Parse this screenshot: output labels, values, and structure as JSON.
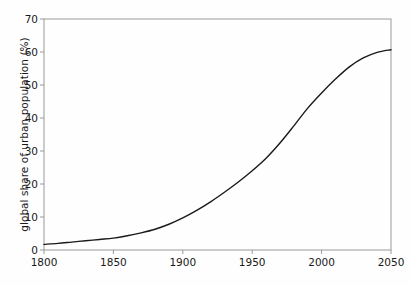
{
  "chart_data": {
    "type": "line",
    "title": "",
    "subtitle": "",
    "xlabel": "",
    "ylabel": "global share of urban population (%)",
    "xlim": [
      1800,
      2050
    ],
    "ylim": [
      0,
      70
    ],
    "xticks": [
      1800,
      1850,
      1900,
      1950,
      2000,
      2050
    ],
    "yticks": [
      0,
      10,
      20,
      30,
      40,
      50,
      60,
      70
    ],
    "xtick_labels": [
      "1800",
      "1850",
      "1900",
      "1950",
      "2000",
      "2050"
    ],
    "ytick_labels": [
      "0",
      "10",
      "20",
      "30",
      "40",
      "50",
      "60",
      "70"
    ],
    "grid": false,
    "legend": null,
    "legend_position": "none",
    "annotations": [],
    "line_color": "#1a1a1a",
    "line_width": 1.4,
    "axis_color": "#9a9a9a",
    "background_color": "#fefefe",
    "series": [
      {
        "name": "global share of urban population",
        "x": [
          1800,
          1810,
          1820,
          1830,
          1840,
          1850,
          1860,
          1870,
          1880,
          1890,
          1900,
          1910,
          1920,
          1930,
          1940,
          1950,
          1960,
          1970,
          1980,
          1990,
          2000,
          2010,
          2020,
          2030,
          2040,
          2050
        ],
        "values": [
          1.7,
          2.0,
          2.4,
          2.8,
          3.2,
          3.6,
          4.3,
          5.2,
          6.3,
          7.8,
          9.7,
          12.0,
          14.6,
          17.5,
          20.6,
          24.0,
          27.8,
          32.4,
          37.6,
          43.0,
          47.6,
          51.8,
          55.5,
          58.2,
          59.9,
          60.7
        ]
      }
    ]
  },
  "plot_geometry": {
    "left": 44,
    "right": 391,
    "top": 19,
    "bottom": 250
  }
}
